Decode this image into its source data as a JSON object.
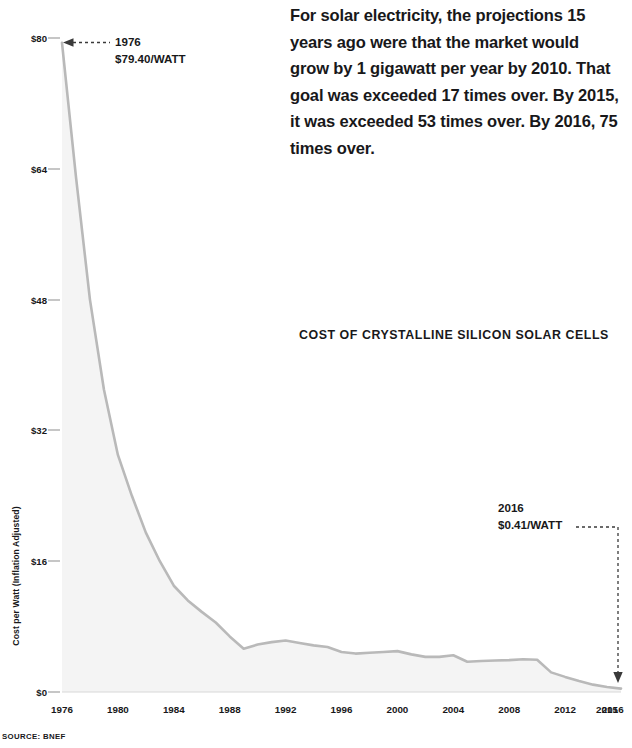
{
  "headline": {
    "text": "For solar electricity, the projections 15 years ago were that the market would grow by 1 gigawatt per year by 2010. That goal was exceeded 17 times over. By 2015, it was exceeded 53 times over. By 2016, 75 times over."
  },
  "source": {
    "text": "SOURCE: BNEF"
  },
  "annotations": {
    "start": {
      "year": "1976",
      "value": "$79.40/WATT"
    },
    "end": {
      "year": "2016",
      "value": "$0.41/WATT"
    }
  },
  "colors": {
    "line": "#b9b9b9",
    "fill": "#f4f4f4",
    "text": "#18181a",
    "tick": "#8d8d8d",
    "leader": "#3a3a3a"
  },
  "chart_data": {
    "type": "line",
    "title": "COST OF CRYSTALLINE SILICON SOLAR CELLS",
    "xlabel": "",
    "ylabel": "Cost per Watt (Inflation Adjusted)",
    "xlim": [
      1976,
      2016
    ],
    "ylim": [
      0,
      80
    ],
    "yticks": [
      0,
      16,
      32,
      48,
      64,
      80
    ],
    "ytick_labels": [
      "$0",
      "$16",
      "$32",
      "$48",
      "$64",
      "$80"
    ],
    "xtick_labels": [
      "1976",
      "1980",
      "1984",
      "1988",
      "1992",
      "1996",
      "2000",
      "2004",
      "2008",
      "2012",
      "2015",
      "2016"
    ],
    "xticks": [
      1976,
      1980,
      1984,
      1988,
      1992,
      1996,
      2000,
      2004,
      2008,
      2012,
      2015,
      2016
    ],
    "grid": false,
    "legend": "none",
    "area_fill": true,
    "x": [
      1976,
      1977,
      1978,
      1979,
      1980,
      1981,
      1982,
      1983,
      1984,
      1985,
      1986,
      1987,
      1988,
      1989,
      1990,
      1991,
      1992,
      1993,
      1994,
      1995,
      1996,
      1997,
      1998,
      1999,
      2000,
      2001,
      2002,
      2003,
      2004,
      2005,
      2006,
      2007,
      2008,
      2009,
      2010,
      2011,
      2012,
      2013,
      2014,
      2015,
      2016
    ],
    "values": [
      79.4,
      63.0,
      48.0,
      37.0,
      29.0,
      24.0,
      19.5,
      16.0,
      13.0,
      11.2,
      9.8,
      8.5,
      6.8,
      5.3,
      5.8,
      6.1,
      6.3,
      6.0,
      5.7,
      5.5,
      4.9,
      4.7,
      4.8,
      4.9,
      5.0,
      4.6,
      4.3,
      4.3,
      4.5,
      3.7,
      3.8,
      3.85,
      3.9,
      4.0,
      3.95,
      2.4,
      1.85,
      1.35,
      0.9,
      0.62,
      0.41
    ],
    "series_name": "Cost per watt"
  }
}
